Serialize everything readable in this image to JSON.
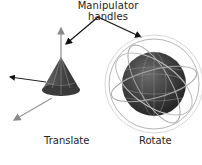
{
  "figure": {
    "title": "Manipulator handles",
    "labels": {
      "translate": "Translate",
      "rotate": "Rotate"
    },
    "objects": [
      {
        "name": "cone",
        "manipulator": "translate",
        "handles": [
          "y-axis-arrow",
          "x-axis-arrow",
          "z-axis-arrow"
        ]
      },
      {
        "name": "sphere",
        "manipulator": "rotate",
        "handles": [
          "outer-ring",
          "x-ring",
          "y-ring",
          "z-ring"
        ]
      }
    ],
    "colors": {
      "object_dark": "#3a3a3a",
      "object_light": "#7a7a7a",
      "wire": "#b8b8b8",
      "handle": "#9a9a9a",
      "arrow": "#111111"
    }
  }
}
